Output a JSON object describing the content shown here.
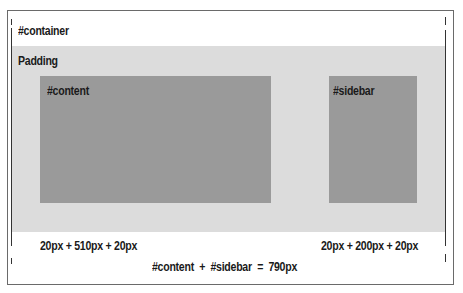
{
  "diagram": {
    "container_label": "#container",
    "padding_label": "Padding",
    "content_label": "#content",
    "sidebar_label": "#sidebar",
    "content_width_calc": "20px + 510px + 20px",
    "sidebar_width_calc": "20px + 200px + 20px",
    "total_calc": "#content  +  #sidebar  =  790px"
  },
  "colors": {
    "container_bg": "#ffffff",
    "padding_bg": "#dcdcdc",
    "box_bg": "#9a9a9a",
    "border": "#6a6a6a",
    "text": "#1a1a1a"
  }
}
